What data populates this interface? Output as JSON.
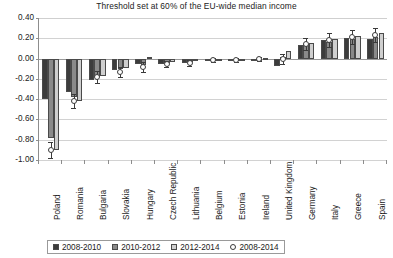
{
  "chart_data": {
    "type": "bar",
    "title": "Threshold set at 60% of the EU-wide median income",
    "xlabel": "",
    "ylabel": "",
    "ylim": [
      -1.0,
      0.4
    ],
    "ytick_labels": [
      "0.40",
      "0.20",
      "0.00",
      "-0.20",
      "-0.40",
      "-0.60",
      "-0.80",
      "-1.00"
    ],
    "ytick_values": [
      0.4,
      0.2,
      0.0,
      -0.2,
      -0.4,
      -0.6,
      -0.8,
      -1.0
    ],
    "grid": true,
    "legend_position": "bottom",
    "categories": [
      "Poland",
      "Romania",
      "Bulgaria",
      "Slovakia",
      "Hungary",
      "Czech Republic",
      "Lithuania",
      "Belgium",
      "Estonia",
      "Ireland",
      "United Kingdom",
      "Germany",
      "Italy",
      "Greece",
      "Spain"
    ],
    "series": [
      {
        "name": "2008-2010",
        "color": "#3c3c3c",
        "values": [
          -0.4,
          -0.33,
          -0.21,
          -0.11,
          -0.05,
          -0.05,
          -0.04,
          -0.01,
          -0.01,
          -0.01,
          -0.07,
          0.13,
          0.18,
          0.2,
          0.19
        ]
      },
      {
        "name": "2010-2012",
        "color": "#8a8a8a",
        "values": [
          -0.78,
          -0.38,
          -0.18,
          -0.1,
          -0.06,
          -0.04,
          -0.03,
          -0.01,
          -0.01,
          0.0,
          0.02,
          0.14,
          0.16,
          0.19,
          0.21
        ]
      },
      {
        "name": "2012-2014",
        "color": "#cfcfcf",
        "values": [
          -0.9,
          -0.42,
          -0.17,
          -0.09,
          0.02,
          -0.03,
          -0.02,
          0.0,
          0.0,
          0.01,
          0.07,
          0.15,
          0.19,
          0.22,
          0.25
        ]
      }
    ],
    "marker_series": {
      "name": "2008-2014",
      "values": [
        -0.9,
        -0.42,
        -0.18,
        -0.13,
        -0.08,
        -0.05,
        -0.04,
        -0.01,
        -0.01,
        0.0,
        0.0,
        0.14,
        0.18,
        0.21,
        0.23
      ],
      "error_low": [
        -0.98,
        -0.49,
        -0.24,
        -0.18,
        -0.13,
        -0.08,
        -0.07,
        -0.03,
        -0.03,
        -0.02,
        -0.05,
        0.08,
        0.11,
        0.14,
        0.16
      ],
      "error_high": [
        -0.82,
        -0.35,
        -0.12,
        -0.08,
        -0.03,
        -0.02,
        -0.01,
        0.01,
        0.01,
        0.02,
        0.05,
        0.2,
        0.25,
        0.28,
        0.3
      ]
    },
    "legend_entries": [
      "2008-2010",
      "2010-2012",
      "2012-2014",
      "2008-2014"
    ]
  }
}
